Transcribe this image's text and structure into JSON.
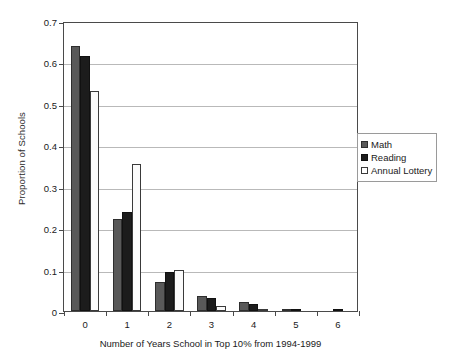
{
  "chart_data": {
    "type": "bar",
    "title": "",
    "xlabel": "Number of Years School in Top 10% from 1994-1999",
    "ylabel": "Proportion of Schools",
    "categories": [
      "0",
      "1",
      "2",
      "3",
      "4",
      "5",
      "6"
    ],
    "ylim": [
      0,
      0.7
    ],
    "yticks": [
      "0",
      "0.1",
      "0.2",
      "0.3",
      "0.4",
      "0.5",
      "0.6",
      "0.7"
    ],
    "ytick_values": [
      0,
      0.1,
      0.2,
      0.3,
      0.4,
      0.5,
      0.6,
      0.7
    ],
    "grid": "horizontal",
    "legend_position": "right",
    "series": [
      {
        "name": "Math",
        "color": "#595959",
        "values": [
          0.64,
          0.223,
          0.069,
          0.036,
          0.021,
          0.004,
          0.0
        ]
      },
      {
        "name": "Reading",
        "color": "#1c1c1c",
        "values": [
          0.615,
          0.238,
          0.094,
          0.032,
          0.016,
          0.001,
          0.003
        ]
      },
      {
        "name": "Annual Lottery",
        "color": "#ffffff",
        "values": [
          0.531,
          0.355,
          0.099,
          0.013,
          0.001,
          0.0,
          0.0
        ]
      }
    ]
  },
  "legend": {
    "items": [
      {
        "label": "Math",
        "swatch": "math"
      },
      {
        "label": "Reading",
        "swatch": "reading"
      },
      {
        "label": "Annual Lottery",
        "swatch": "lottery"
      }
    ]
  }
}
